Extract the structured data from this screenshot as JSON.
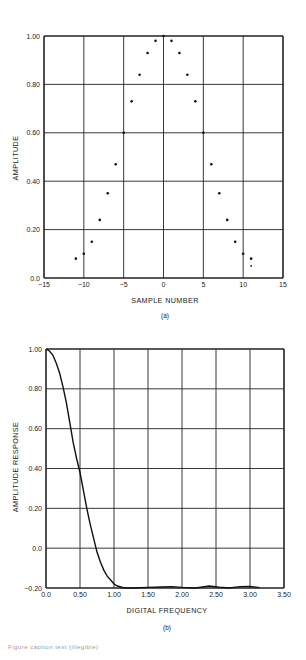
{
  "chart_data": [
    {
      "type": "scatter",
      "panel": "(a)",
      "xlabel": "SAMPLE NUMBER",
      "ylabel": "AMPLITUDE",
      "xlim": [
        -15,
        15
      ],
      "ylim": [
        0.0,
        1.0
      ],
      "xticks": [
        "-15",
        "-10",
        "-5",
        "0",
        "5",
        "10",
        "15"
      ],
      "yticks": [
        "0.0",
        "0.20",
        "0.40",
        "0.60",
        "0.80",
        "1.00"
      ],
      "grid": true,
      "points": [
        {
          "x": -11,
          "y": 0.08
        },
        {
          "x": -10,
          "y": 0.1
        },
        {
          "x": -9,
          "y": 0.15
        },
        {
          "x": -8,
          "y": 0.24
        },
        {
          "x": -7,
          "y": 0.35
        },
        {
          "x": -6,
          "y": 0.47
        },
        {
          "x": -5,
          "y": 0.6
        },
        {
          "x": -4,
          "y": 0.73
        },
        {
          "x": -3,
          "y": 0.84
        },
        {
          "x": -2,
          "y": 0.93
        },
        {
          "x": -1,
          "y": 0.98
        },
        {
          "x": 0,
          "y": 1.0
        },
        {
          "x": 1,
          "y": 0.98
        },
        {
          "x": 2,
          "y": 0.93
        },
        {
          "x": 3,
          "y": 0.84
        },
        {
          "x": 4,
          "y": 0.73
        },
        {
          "x": 5,
          "y": 0.6
        },
        {
          "x": 6,
          "y": 0.47
        },
        {
          "x": 7,
          "y": 0.35
        },
        {
          "x": 8,
          "y": 0.24
        },
        {
          "x": 9,
          "y": 0.15
        },
        {
          "x": 10,
          "y": 0.1
        },
        {
          "x": 11,
          "y": 0.08
        },
        {
          "x": 11,
          "y": 0.05
        }
      ]
    },
    {
      "type": "line",
      "panel": "(b)",
      "xlabel": "DIGITAL FREQUENCY",
      "ylabel": "AMPLITUDE RESPONSE",
      "xlim": [
        0.0,
        3.5
      ],
      "ylim": [
        -0.2,
        1.0
      ],
      "xticks": [
        "0.0",
        "0.50",
        "1.00",
        "1.50",
        "2.00",
        "2.50",
        "3.00",
        "3.50"
      ],
      "yticks": [
        "-0.20",
        "0.0",
        "0.20",
        "0.40",
        "0.60",
        "0.80",
        "1.00"
      ],
      "grid": true,
      "series": [
        {
          "name": "amplitude response",
          "x": [
            0.0,
            0.05,
            0.1,
            0.15,
            0.2,
            0.25,
            0.3,
            0.35,
            0.4,
            0.45,
            0.5,
            0.55,
            0.6,
            0.65,
            0.7,
            0.75,
            0.8,
            0.85,
            0.9,
            0.95,
            1.0,
            1.05,
            1.1,
            1.15,
            1.2,
            1.3,
            1.5,
            1.7,
            1.85,
            2.0,
            2.2,
            2.4,
            2.55,
            2.7,
            2.85,
            3.0,
            3.14
          ],
          "y": [
            1.0,
            0.99,
            0.97,
            0.93,
            0.88,
            0.81,
            0.73,
            0.63,
            0.53,
            0.45,
            0.38,
            0.29,
            0.2,
            0.12,
            0.05,
            -0.02,
            -0.07,
            -0.11,
            -0.14,
            -0.16,
            -0.18,
            -0.19,
            -0.195,
            -0.2,
            -0.2,
            -0.2,
            -0.197,
            -0.195,
            -0.193,
            -0.197,
            -0.2,
            -0.19,
            -0.196,
            -0.2,
            -0.193,
            -0.192,
            -0.198
          ]
        }
      ]
    }
  ],
  "panels": {
    "a": {
      "sub_label": "(a)",
      "xlabel": "SAMPLE NUMBER",
      "ylabel": "AMPLITUDE",
      "xticks": [
        "−15",
        "−10",
        "−5",
        "0",
        "5",
        "10",
        "15"
      ],
      "yticks": [
        "0.0",
        "0.20",
        "0.40",
        "0.60",
        "0.80",
        "1.00"
      ]
    },
    "b": {
      "sub_label": "(b)",
      "xlabel": "DIGITAL FREQUENCY",
      "ylabel": "AMPLITUDE RESPONSE",
      "xticks": [
        "0.0",
        "0.50",
        "1.00",
        "1.50",
        "2.00",
        "2.50",
        "3.00",
        "3.50"
      ],
      "yticks": [
        "−0.20",
        "0.0",
        "0.20",
        "0.40",
        "0.60",
        "0.80",
        "1.00"
      ]
    }
  },
  "caption": "Figure caption text (illegible)"
}
